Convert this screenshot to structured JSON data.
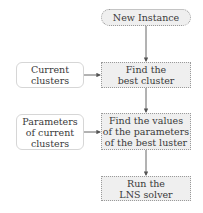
{
  "diagram": {
    "nodes": [
      {
        "id": "new-instance",
        "label": "New Instance",
        "shape": "rounded-terminal"
      },
      {
        "id": "current-clusters",
        "label": "Current\nclusters",
        "shape": "rounded-input"
      },
      {
        "id": "find-best-cluster",
        "label": "Find the\nbest cluster",
        "shape": "process"
      },
      {
        "id": "parameters-current-clusters",
        "label": "Parameters\nof current\nclusters",
        "shape": "rounded-input"
      },
      {
        "id": "find-values-parameters",
        "label": "Find the values\nof the parameters\nof the best luster",
        "shape": "process"
      },
      {
        "id": "run-lns-solver",
        "label": "Run the\nLNS solver",
        "shape": "process"
      }
    ],
    "edges": [
      {
        "from": "new-instance",
        "to": "find-best-cluster"
      },
      {
        "from": "current-clusters",
        "to": "find-best-cluster"
      },
      {
        "from": "find-best-cluster",
        "to": "find-values-parameters"
      },
      {
        "from": "parameters-current-clusters",
        "to": "find-values-parameters"
      },
      {
        "from": "find-values-parameters",
        "to": "run-lns-solver"
      }
    ],
    "colors": {
      "process_fill": "#efefef",
      "border": "#9a9a9a",
      "edge": "#555555",
      "text": "#3a3a3a"
    }
  }
}
